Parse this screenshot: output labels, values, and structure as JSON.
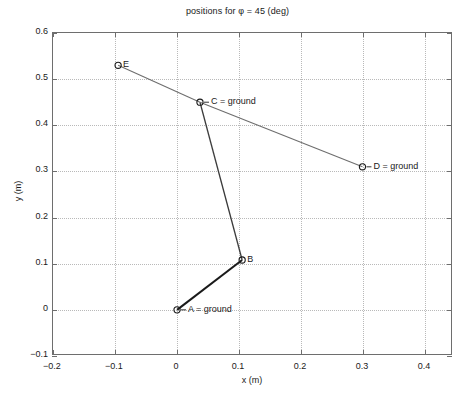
{
  "chart_data": {
    "type": "scatter",
    "title": "positions for φ = 45 (deg)",
    "xlabel": "x (m)",
    "ylabel": "y (m)",
    "xlim": [
      -0.2,
      0.445
    ],
    "ylim": [
      -0.1,
      0.6
    ],
    "xticks": [
      -0.2,
      -0.1,
      0,
      0.1,
      0.2,
      0.3,
      0.4
    ],
    "xticklabels": [
      "−0.2",
      "−0.1",
      "0",
      "0.1",
      "0.2",
      "0.3",
      "0.4"
    ],
    "yticks": [
      -0.1,
      0,
      0.1,
      0.2,
      0.3,
      0.4,
      0.5,
      0.6
    ],
    "yticklabels": [
      "−0.1",
      "0",
      "0.1",
      "0.2",
      "0.3",
      "0.4",
      "0.5",
      "0.6"
    ],
    "grid": true,
    "grid_style": "dotted",
    "legend": "none",
    "points": [
      {
        "id": "A",
        "label": "A = ground",
        "x": 0.0,
        "y": 0.0,
        "label_side": "right",
        "marker": "circle"
      },
      {
        "id": "B",
        "label": "B",
        "x": 0.105,
        "y": 0.108,
        "label_side": "right",
        "marker": "circle"
      },
      {
        "id": "C",
        "label": "C = ground",
        "x": 0.037,
        "y": 0.45,
        "label_side": "right",
        "marker": "circle"
      },
      {
        "id": "D",
        "label": "D = ground",
        "x": 0.299,
        "y": 0.31,
        "label_side": "right",
        "marker": "circle"
      },
      {
        "id": "E",
        "label": "E",
        "x": -0.095,
        "y": 0.53,
        "label_side": "right",
        "marker": "circle"
      }
    ],
    "links": [
      {
        "name": "link-A-B",
        "from": "A",
        "to": "B",
        "color": "#1a1a1a",
        "width": 2.0
      },
      {
        "name": "link-B-C",
        "from": "B",
        "to": "C",
        "color": "#3c3c3c",
        "width": 1.3
      },
      {
        "name": "link-E-C",
        "from": "E",
        "to": "C",
        "color": "#6e6e6e",
        "width": 1.1
      },
      {
        "name": "link-C-D",
        "from": "C",
        "to": "D",
        "color": "#6e6e6e",
        "width": 1.1
      }
    ]
  },
  "axes": {
    "title": "positions for φ = 45 (deg)",
    "xlabel": "x (m)",
    "ylabel": "y (m)"
  },
  "colors": {
    "axis": "#6e6e6e",
    "grid": "#b9b9b9",
    "text": "#1a1a1a",
    "link_dark": "#1a1a1a",
    "link_gray": "#6e6e6e",
    "background": "#ffffff"
  }
}
